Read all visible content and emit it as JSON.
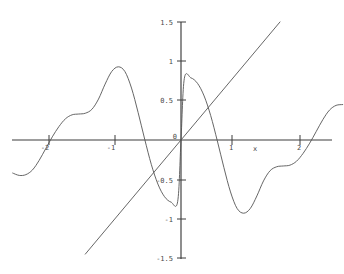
{
  "chart_data": {
    "type": "line",
    "title": "",
    "subtitle": "",
    "xlabel": "x",
    "ylabel": "",
    "grid": false,
    "legend": "none",
    "xlim": [
      -2.55,
      2.45
    ],
    "ylim": [
      -1.5,
      1.5
    ],
    "x_ticks": [
      -2,
      -1,
      1,
      2
    ],
    "x_tick_labels": [
      "-2",
      "-1",
      "1",
      "2"
    ],
    "y_ticks": [
      -1.5,
      -1,
      -0.5,
      0,
      0.5,
      1,
      1.5
    ],
    "y_tick_labels": [
      "-1.5",
      "-1",
      "-0.5",
      "0",
      "0.5",
      "1",
      "1.5"
    ],
    "origin_label": "0",
    "series": [
      {
        "name": "oscillating-curve",
        "type": "line",
        "color": "#555555",
        "x": [
          -2.55,
          -2.45,
          -2.35,
          -2.25,
          -2.15,
          -2.05,
          -1.95,
          -1.85,
          -1.75,
          -1.65,
          -1.55,
          -1.45,
          -1.35,
          -1.25,
          -1.15,
          -1.05,
          -0.95,
          -0.85,
          -0.75,
          -0.65,
          -0.55,
          -0.45,
          -0.35,
          -0.25,
          -0.15,
          -0.05,
          0.0,
          0.05,
          0.15,
          0.25,
          0.35,
          0.45,
          0.55,
          0.65,
          0.75,
          0.85,
          0.95,
          1.05,
          1.15,
          1.25,
          1.35,
          1.45,
          1.55,
          1.65,
          1.75,
          1.85,
          1.95,
          2.05,
          2.15,
          2.25,
          2.35,
          2.45
        ],
        "y": [
          -0.42,
          -0.45,
          -0.44,
          -0.38,
          -0.26,
          -0.11,
          0.04,
          0.17,
          0.27,
          0.32,
          0.33,
          0.34,
          0.39,
          0.52,
          0.71,
          0.87,
          0.93,
          0.87,
          0.66,
          0.35,
          0.01,
          -0.31,
          -0.56,
          -0.72,
          -0.79,
          -0.78,
          0.0,
          0.78,
          0.79,
          0.72,
          0.56,
          0.31,
          -0.01,
          -0.35,
          -0.66,
          -0.87,
          -0.93,
          -0.87,
          -0.71,
          -0.52,
          -0.39,
          -0.34,
          -0.33,
          -0.32,
          -0.27,
          -0.17,
          -0.04,
          0.11,
          0.26,
          0.38,
          0.44,
          0.45
        ]
      },
      {
        "name": "identity-line",
        "type": "line",
        "color": "#555555",
        "x": [
          -1.45,
          1.5
        ],
        "y": [
          -1.45,
          1.5
        ]
      }
    ],
    "annotations": []
  },
  "figure": {
    "background_color": "#ffffff",
    "axis_color": "#3c3c3c",
    "curve_color": "#555555",
    "text_color": "#4a4a4a"
  }
}
